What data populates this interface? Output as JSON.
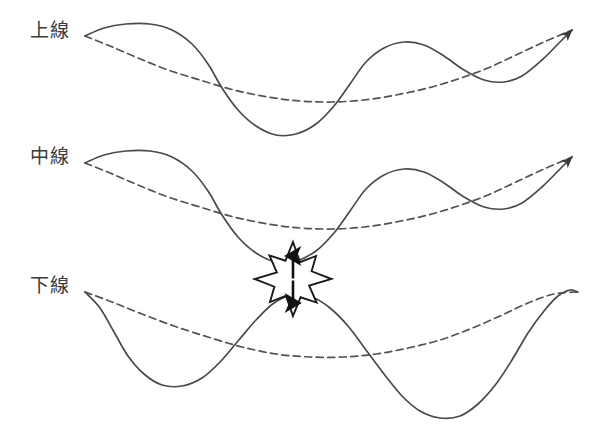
{
  "figure": {
    "background_color": "#ffffff",
    "stroke_color": "#4a4a48",
    "dash_color": "#55534f",
    "burst_fill": "#ffffff",
    "burst_stroke": "#1a1a1a",
    "arrow_color": "#111111",
    "width": 600,
    "height": 437
  },
  "labels": {
    "upper": "上線",
    "middle": "中線",
    "lower": "下線"
  },
  "chart_data": {
    "type": "line",
    "xlabel": "",
    "ylabel": "",
    "grid": false,
    "legend_position": "left",
    "axis_hidden": true,
    "xlim": [
      85,
      572
    ],
    "ylim": [
      0,
      437
    ],
    "annotations": [
      {
        "name": "collision-burst",
        "shape": "starburst",
        "points": 8,
        "center_x": 293,
        "center_y": 279,
        "outer_radius": 37,
        "inner_radius": 19,
        "contains": "vertical-double-arrow"
      },
      {
        "name": "gap-arrow",
        "shape": "double-headed-arrow",
        "orientation": "vertical",
        "x": 293,
        "y_top": 256,
        "y_bottom": 303
      }
    ],
    "series": [
      {
        "name": "上線 実線",
        "group": "upper",
        "style": "solid",
        "arrowhead": true,
        "points": [
          [
            85,
            36
          ],
          [
            104,
            28
          ],
          [
            126,
            24
          ],
          [
            150,
            24
          ],
          [
            172,
            30
          ],
          [
            192,
            44
          ],
          [
            208,
            64
          ],
          [
            222,
            88
          ],
          [
            238,
            110
          ],
          [
            256,
            126
          ],
          [
            276,
            135
          ],
          [
            296,
            134
          ],
          [
            316,
            124
          ],
          [
            334,
            106
          ],
          [
            350,
            84
          ],
          [
            366,
            62
          ],
          [
            384,
            48
          ],
          [
            404,
            42
          ],
          [
            424,
            45
          ],
          [
            444,
            56
          ],
          [
            464,
            70
          ],
          [
            484,
            80
          ],
          [
            504,
            82
          ],
          [
            522,
            76
          ],
          [
            542,
            60
          ],
          [
            560,
            42
          ],
          [
            572,
            30
          ]
        ]
      },
      {
        "name": "上線 破線",
        "group": "upper",
        "style": "dashed",
        "arrowhead": false,
        "points": [
          [
            85,
            36
          ],
          [
            110,
            46
          ],
          [
            138,
            58
          ],
          [
            168,
            70
          ],
          [
            200,
            80
          ],
          [
            234,
            90
          ],
          [
            268,
            97
          ],
          [
            300,
            101
          ],
          [
            332,
            102
          ],
          [
            364,
            100
          ],
          [
            396,
            95
          ],
          [
            428,
            88
          ],
          [
            458,
            79
          ],
          [
            488,
            68
          ],
          [
            516,
            55
          ],
          [
            544,
            42
          ],
          [
            572,
            30
          ]
        ]
      },
      {
        "name": "中線 実線",
        "group": "middle",
        "style": "solid",
        "arrowhead": true,
        "points": [
          [
            85,
            163
          ],
          [
            104,
            155
          ],
          [
            126,
            151
          ],
          [
            150,
            151
          ],
          [
            172,
            157
          ],
          [
            192,
            171
          ],
          [
            208,
            191
          ],
          [
            222,
            215
          ],
          [
            238,
            237
          ],
          [
            256,
            253
          ],
          [
            276,
            262
          ],
          [
            296,
            261
          ],
          [
            316,
            251
          ],
          [
            334,
            233
          ],
          [
            350,
            211
          ],
          [
            366,
            189
          ],
          [
            384,
            175
          ],
          [
            404,
            169
          ],
          [
            424,
            172
          ],
          [
            444,
            183
          ],
          [
            464,
            197
          ],
          [
            484,
            207
          ],
          [
            504,
            209
          ],
          [
            522,
            203
          ],
          [
            542,
            187
          ],
          [
            560,
            169
          ],
          [
            572,
            157
          ]
        ]
      },
      {
        "name": "中線 破線",
        "group": "middle",
        "style": "dashed",
        "arrowhead": false,
        "points": [
          [
            85,
            163
          ],
          [
            110,
            173
          ],
          [
            138,
            185
          ],
          [
            168,
            197
          ],
          [
            200,
            207
          ],
          [
            234,
            217
          ],
          [
            268,
            224
          ],
          [
            300,
            228
          ],
          [
            332,
            229
          ],
          [
            364,
            227
          ],
          [
            396,
            222
          ],
          [
            428,
            215
          ],
          [
            458,
            206
          ],
          [
            488,
            195
          ],
          [
            516,
            182
          ],
          [
            544,
            169
          ],
          [
            572,
            157
          ]
        ]
      },
      {
        "name": "下線 実線",
        "group": "lower",
        "style": "solid",
        "arrowhead": false,
        "points": [
          [
            85,
            292
          ],
          [
            100,
            308
          ],
          [
            114,
            332
          ],
          [
            128,
            356
          ],
          [
            144,
            374
          ],
          [
            162,
            385
          ],
          [
            182,
            386
          ],
          [
            202,
            378
          ],
          [
            220,
            362
          ],
          [
            238,
            341
          ],
          [
            256,
            320
          ],
          [
            274,
            303
          ],
          [
            293,
            295
          ],
          [
            312,
            297
          ],
          [
            330,
            308
          ],
          [
            348,
            326
          ],
          [
            366,
            350
          ],
          [
            384,
            374
          ],
          [
            402,
            396
          ],
          [
            420,
            411
          ],
          [
            440,
            418
          ],
          [
            460,
            416
          ],
          [
            478,
            404
          ],
          [
            496,
            384
          ],
          [
            512,
            360
          ],
          [
            528,
            333
          ],
          [
            544,
            311
          ],
          [
            558,
            296
          ],
          [
            570,
            290
          ],
          [
            578,
            292
          ]
        ]
      },
      {
        "name": "下線 破線",
        "group": "lower",
        "style": "dashed",
        "arrowhead": false,
        "points": [
          [
            85,
            292
          ],
          [
            112,
            302
          ],
          [
            142,
            314
          ],
          [
            174,
            326
          ],
          [
            208,
            337
          ],
          [
            242,
            347
          ],
          [
            276,
            354
          ],
          [
            310,
            357
          ],
          [
            344,
            357
          ],
          [
            376,
            354
          ],
          [
            408,
            348
          ],
          [
            440,
            340
          ],
          [
            470,
            329
          ],
          [
            500,
            316
          ],
          [
            528,
            303
          ],
          [
            554,
            294
          ],
          [
            578,
            292
          ]
        ]
      }
    ]
  }
}
